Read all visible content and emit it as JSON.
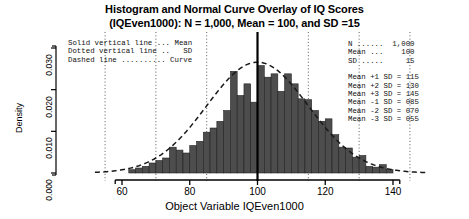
{
  "title": {
    "line1": "Histogram and Normal Curve Overlay of IQ Scores",
    "line2": "(IQEven1000): N = 1,000, Mean = 100, and SD =15"
  },
  "legend": {
    "lines": [
      "Solid vertical line ... Mean",
      "Dotted vertical line ..   SD",
      "Dashed line .......... Curve"
    ]
  },
  "stats": {
    "summary": [
      "N ......  1,000",
      "Mean ...    100",
      "SD .....     15"
    ],
    "sd_lines": [
      "Mean +1 SD = 115",
      "Mean +2 SD = 130",
      "Mean +3 SD = 145",
      "Mean -1 SD = 085",
      "Mean -2 SD = 070",
      "Mean -3 SD = 055"
    ]
  },
  "chart_data": {
    "type": "bar",
    "title": "Histogram and Normal Curve Overlay of IQ Scores (IQEven1000): N = 1,000, Mean = 100, and SD =15",
    "xlabel": "Object Variable IQEven1000",
    "ylabel": "Density",
    "xlim": [
      52,
      150
    ],
    "ylim": [
      0.0,
      0.0335
    ],
    "xticks": [
      60,
      80,
      100,
      120,
      140
    ],
    "xtick_labels": [
      "60",
      "80",
      "100",
      "120",
      "140"
    ],
    "yticks": [
      0.0,
      0.01,
      0.02,
      0.03
    ],
    "ytick_labels": [
      "0.000",
      "0.010",
      "0.020",
      "0.030"
    ],
    "grid": false,
    "bin_width": 2,
    "bin_starts": [
      62,
      64,
      66,
      68,
      70,
      72,
      74,
      76,
      78,
      80,
      82,
      84,
      86,
      88,
      90,
      92,
      94,
      96,
      98,
      100,
      102,
      104,
      106,
      108,
      110,
      112,
      114,
      116,
      118,
      120,
      122,
      124,
      126,
      128,
      130,
      132,
      134,
      136,
      138
    ],
    "values": [
      0.0008,
      0.0012,
      0.0016,
      0.0024,
      0.003,
      0.0036,
      0.0062,
      0.0055,
      0.0048,
      0.0066,
      0.0076,
      0.0098,
      0.0108,
      0.0124,
      0.015,
      0.0244,
      0.0186,
      0.0214,
      0.017,
      0.0258,
      0.023,
      0.0238,
      0.0196,
      0.0238,
      0.0214,
      0.0178,
      0.0176,
      0.015,
      0.0124,
      0.013,
      0.0092,
      0.0062,
      0.006,
      0.0038,
      0.0042,
      0.0016,
      0.0014,
      0.002,
      0.0008
    ],
    "bar_color": "#4d4d4d",
    "series": [
      {
        "name": "Curve",
        "type": "line",
        "style": "dashed",
        "mean": 100,
        "sd": 15,
        "peak": 0.0266
      }
    ],
    "annotations": [
      {
        "name": "mean-line",
        "style": "solid",
        "x": 100
      },
      {
        "name": "sd-line",
        "style": "dotted",
        "x": 55
      },
      {
        "name": "sd-line",
        "style": "dotted",
        "x": 70
      },
      {
        "name": "sd-line",
        "style": "dotted",
        "x": 85
      },
      {
        "name": "sd-line",
        "style": "dotted",
        "x": 115
      },
      {
        "name": "sd-line",
        "style": "dotted",
        "x": 130
      },
      {
        "name": "sd-line",
        "style": "dotted",
        "x": 145
      }
    ]
  }
}
